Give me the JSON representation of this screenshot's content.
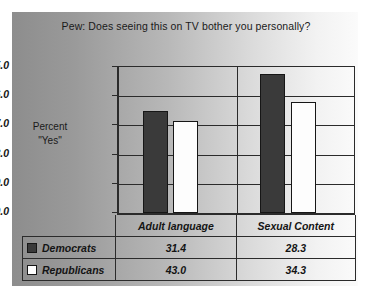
{
  "chart_data": {
    "type": "bar",
    "title": "Pew: Does seeing this on TV bother you personally?",
    "xlabel": "",
    "ylabel": "Percent \"Yes\"",
    "categories": [
      "Adult language",
      "Sexual Content"
    ],
    "series": [
      {
        "name": "Democrats",
        "values": [
          31.4,
          43.0
        ],
        "color": "#3a3a3a",
        "swatch": "filled"
      },
      {
        "name": "Republicans",
        "values": [
          28.3,
          34.3
        ],
        "color": "#ffffff",
        "swatch": "empty"
      }
    ],
    "series_note": "Row order in table is Democrats then Republicans; per-category bar order is Democrats then Republicans",
    "table_values": [
      [
        "31.4",
        "28.3"
      ],
      [
        "43.0",
        "34.3"
      ]
    ],
    "ylim": [
      0.0,
      45.0
    ],
    "ytick_labels": [
      "45.0",
      "36.0",
      "27.0",
      "18.0",
      "9.0",
      "0.0"
    ],
    "ytick_values": [
      45.0,
      36.0,
      27.0,
      18.0,
      9.0,
      0.0
    ],
    "grid": true,
    "legend_position": "table-left-column",
    "bars": [
      {
        "category": "Adult language",
        "series": "Democrats",
        "value": 31.4
      },
      {
        "category": "Adult language",
        "series": "Republicans",
        "value": 43.0
      },
      {
        "category": "Sexual Content",
        "series": "Democrats",
        "value": 28.3
      },
      {
        "category": "Sexual Content",
        "series": "Republicans",
        "value": 34.3
      }
    ]
  },
  "axis": {
    "label_line1": "Percent",
    "label_line2": "\"Yes\""
  }
}
